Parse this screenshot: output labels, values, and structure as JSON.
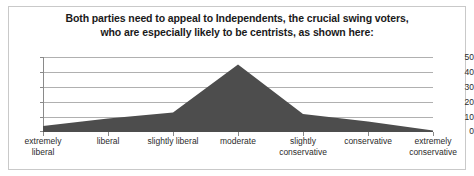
{
  "chart_data": {
    "type": "area",
    "title": "Both parties need to appeal to Independents, the crucial swing voters, who are especially likely to be centrists, as shown here:",
    "title_lines": [
      "Both parties need to appeal to Independents, the crucial swing voters,",
      "who are especially likely to be centrists, as shown here:"
    ],
    "xlabel": "",
    "ylabel": "",
    "categories": [
      "extremely liberal",
      "liberal",
      "slightly liberal",
      "moderate",
      "slightly conservative",
      "conservative",
      "extremely conservative"
    ],
    "category_lines": [
      [
        "extremely",
        "liberal"
      ],
      [
        "liberal",
        ""
      ],
      [
        "slightly liberal",
        ""
      ],
      [
        "moderate",
        ""
      ],
      [
        "slightly",
        "conservative"
      ],
      [
        "conservative",
        ""
      ],
      [
        "extremely",
        "conservative"
      ]
    ],
    "values": [
      4,
      9,
      13,
      45,
      12,
      7,
      1
    ],
    "ylim": [
      0,
      50
    ],
    "yticks": [
      0,
      10,
      20,
      30,
      40,
      50
    ],
    "ytick_labels": [
      "0",
      "10",
      "20",
      "30",
      "40",
      "50"
    ],
    "grid": true,
    "legend": false,
    "series_color": "#4d4d4d",
    "grid_color": "#b0b0b0",
    "axis_color": "#8a8a8a",
    "border_color": "#c9c9c9",
    "text_color": "#2b2b2b",
    "title_color": "#1a1a1a"
  }
}
